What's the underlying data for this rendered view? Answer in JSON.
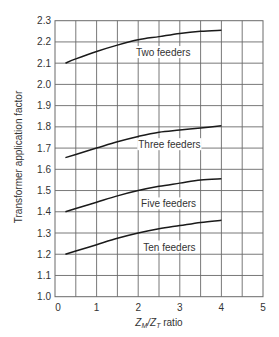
{
  "chart_data": {
    "type": "line",
    "title": "",
    "xlabel": {
      "main": "Z",
      "sub1": "M",
      "slash": "/Z",
      "sub2": "T",
      "rest": " ratio",
      "full": "Z_M/Z_T ratio"
    },
    "ylabel": "Transformer application factor",
    "xlim": [
      0,
      5
    ],
    "ylim": [
      1.0,
      2.3
    ],
    "x_ticks": [
      0,
      1,
      2,
      3,
      4,
      5
    ],
    "x_tick_labels": [
      "0",
      "1",
      "2",
      "3",
      "4",
      "5"
    ],
    "x_grid_step": 0.5,
    "y_ticks": [
      1.0,
      1.1,
      1.2,
      1.3,
      1.4,
      1.5,
      1.6,
      1.7,
      1.8,
      1.9,
      2.0,
      2.1,
      2.2,
      2.3
    ],
    "y_tick_labels": [
      "1.0",
      "1.1",
      "1.2",
      "1.3",
      "1.4",
      "1.5",
      "1.6",
      "1.7",
      "1.8",
      "1.9",
      "2.0",
      "2.1",
      "2.2",
      "2.3"
    ],
    "grid": true,
    "legend": "inline labels beneath each curve",
    "series": [
      {
        "name": "Two feeders",
        "x": [
          0.25,
          0.5,
          1.0,
          1.5,
          2.0,
          2.5,
          3.0,
          3.5,
          4.0
        ],
        "y": [
          2.1,
          2.12,
          2.155,
          2.185,
          2.21,
          2.225,
          2.24,
          2.25,
          2.255
        ],
        "label_at": [
          2.6,
          2.15
        ]
      },
      {
        "name": "Three feeders",
        "x": [
          0.25,
          0.5,
          1.0,
          1.5,
          2.0,
          2.5,
          3.0,
          3.5,
          4.0
        ],
        "y": [
          1.655,
          1.67,
          1.7,
          1.73,
          1.755,
          1.775,
          1.785,
          1.795,
          1.805
        ],
        "label_at": [
          2.75,
          1.716
        ]
      },
      {
        "name": "Five feeders",
        "x": [
          0.25,
          0.5,
          1.0,
          1.5,
          2.0,
          2.5,
          3.0,
          3.5,
          4.0
        ],
        "y": [
          1.4,
          1.415,
          1.445,
          1.475,
          1.5,
          1.52,
          1.535,
          1.55,
          1.555
        ],
        "label_at": [
          2.73,
          1.437
        ]
      },
      {
        "name": "Ten feeders",
        "x": [
          0.25,
          0.5,
          1.0,
          1.5,
          2.0,
          2.5,
          3.0,
          3.5,
          4.0
        ],
        "y": [
          1.2,
          1.215,
          1.245,
          1.275,
          1.3,
          1.32,
          1.335,
          1.35,
          1.36
        ],
        "label_at": [
          2.75,
          1.234
        ]
      }
    ]
  }
}
